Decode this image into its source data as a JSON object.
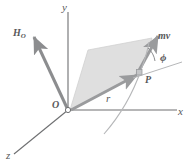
{
  "figure": {
    "background_color": "#ffffff",
    "axes": {
      "x_label": "x",
      "y_label": "y",
      "z_label": "z",
      "axis_color": "#6e6f71"
    },
    "origin": {
      "label": "O",
      "marker": "open-circle",
      "x": 68,
      "y": 110
    },
    "point": {
      "label": "P",
      "marker": "small-square",
      "x": 141,
      "y": 71
    },
    "vectors": [
      {
        "name": "angular-momentum",
        "label": "H",
        "subscript": "O",
        "color": "#8c8d8f",
        "from": [
          68,
          110
        ],
        "to": [
          32,
          35
        ]
      },
      {
        "name": "linear-momentum",
        "label": "mv",
        "subscript": "",
        "color": "#9a9b9d",
        "from": [
          136,
          74
        ],
        "to": [
          158,
          35
        ]
      },
      {
        "name": "position-vector",
        "label": "r",
        "subscript": "",
        "color": "#9a9b9d",
        "from": [
          70,
          110
        ],
        "to": [
          138,
          74
        ]
      }
    ],
    "plane": {
      "name": "momentum-plane",
      "fill_color": "#d9d9d9",
      "stroke_color": "#c8c8c8",
      "points": "70,110 88,50 152,38 140,73"
    },
    "angle": {
      "label": "ϕ",
      "name": "phi",
      "arc_color": "#8c8d8f"
    },
    "trajectory": {
      "name": "particle-path",
      "color": "#b4b5b7",
      "style": "curved-dashed-solid"
    },
    "tangent_line": {
      "name": "tangent-reference-line",
      "color": "#b4b5b7"
    }
  }
}
